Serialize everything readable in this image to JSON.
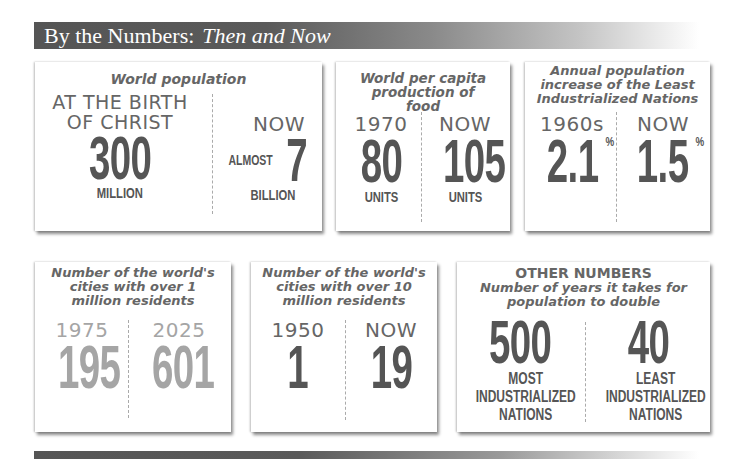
{
  "header": {
    "title": "By the Numbers:",
    "subtitle": "Then and Now"
  },
  "cards": [
    {
      "title": "World population",
      "left": {
        "label": "AT THE BIRTH OF CHRIST",
        "value": "300",
        "unit": "MILLION"
      },
      "right": {
        "label": "NOW",
        "prefix": "ALMOST",
        "value": "7",
        "unit": "BILLION"
      }
    },
    {
      "title": "World per capita production of food",
      "left": {
        "label": "1970",
        "value": "80",
        "unit": "UNITS"
      },
      "right": {
        "label": "NOW",
        "value": "105",
        "unit": "UNITS"
      }
    },
    {
      "title": "Annual population increase of the Least Industrialized Nations",
      "left": {
        "label": "1960s",
        "value": "2.1",
        "suffix": "%"
      },
      "right": {
        "label": "NOW",
        "value": "1.5",
        "suffix": "%"
      }
    },
    {
      "title": "Number of the world's cities with over 1 million residents",
      "left": {
        "label": "1975",
        "value": "195"
      },
      "right": {
        "label": "2025",
        "value": "601"
      }
    },
    {
      "title": "Number of the world's cities with over 10 million residents",
      "left": {
        "label": "1950",
        "value": "1"
      },
      "right": {
        "label": "NOW",
        "value": "19"
      }
    },
    {
      "heading": "OTHER NUMBERS",
      "title": "Number of years it takes for population to double",
      "left": {
        "value": "500",
        "unit": "MOST INDUSTRIALIZED NATIONS"
      },
      "right": {
        "value": "40",
        "unit": "LEAST INDUSTRIALIZED NATIONS"
      }
    }
  ]
}
